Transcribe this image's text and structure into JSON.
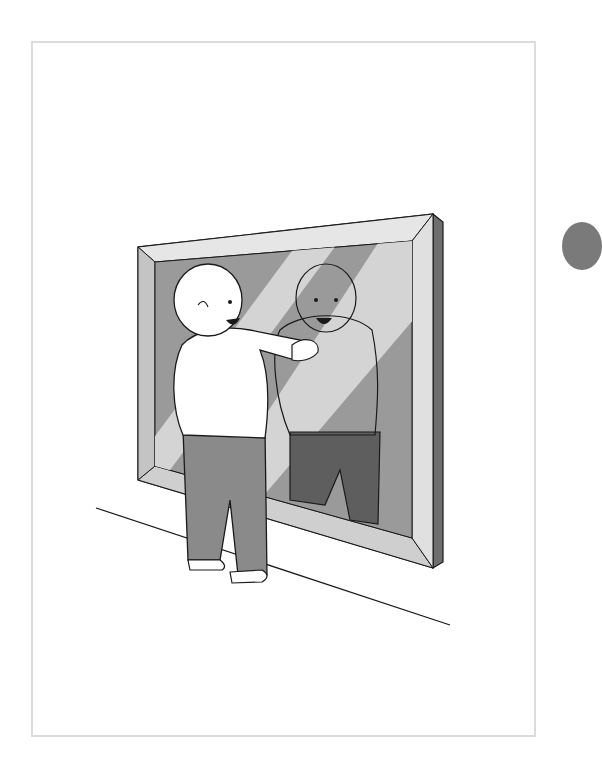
{
  "illustration": {
    "subject": "toddler looking at reflection in mirror",
    "colors": {
      "frame_border": "#dcdcdc",
      "mirror_frame_light": "#d9d9d9",
      "mirror_frame_side": "#6e6e6e",
      "mirror_glass": "#9a9a9a",
      "mirror_highlight": "#d4d4d4",
      "pants": "#8a8a8a",
      "reflection_pants": "#5e5e5e",
      "outline": "#1a1a1a",
      "edge_circle": "#7a7a7a"
    }
  }
}
